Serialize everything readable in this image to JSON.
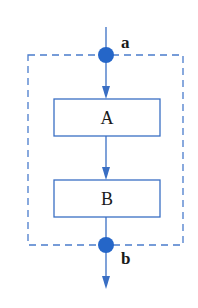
{
  "diagram": {
    "colors": {
      "line": "#3a6fc4",
      "node": "#2566c8",
      "box_border": "#3a6fc4",
      "dashed": "#4a7ccc",
      "text": "#1a1a1a"
    },
    "boxes": [
      {
        "id": "A",
        "label": "A"
      },
      {
        "id": "B",
        "label": "B"
      }
    ],
    "nodes": [
      {
        "id": "a",
        "label": "a"
      },
      {
        "id": "b",
        "label": "b"
      }
    ]
  }
}
